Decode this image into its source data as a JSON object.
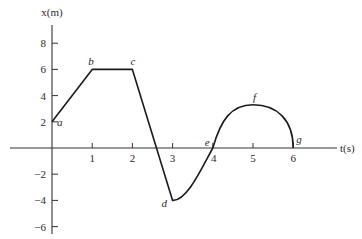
{
  "chart_data": {
    "type": "line",
    "title": "",
    "xlabel": "t(s)",
    "ylabel": "x(m)",
    "xlim": [
      0,
      6
    ],
    "ylim": [
      -6,
      8
    ],
    "grid": false,
    "legend": null,
    "x_ticks": [
      1,
      2,
      3,
      4,
      5,
      6
    ],
    "x_tick_labels": [
      "1",
      "2",
      "3",
      "4",
      "5",
      "6"
    ],
    "y_ticks": [
      8,
      6,
      4,
      2,
      -2,
      -4,
      -6
    ],
    "y_tick_labels": [
      "8",
      "6",
      "4",
      "2",
      "−2",
      "−4",
      "−6"
    ],
    "series": [
      {
        "name": "position",
        "points": [
          {
            "label": "a",
            "t": 0,
            "x": 2
          },
          {
            "label": "b",
            "t": 1,
            "x": 6
          },
          {
            "label": "c",
            "t": 2,
            "x": 6
          },
          {
            "label": "d",
            "t": 3,
            "x": -4
          },
          {
            "label": "e",
            "t": 4,
            "x": 0
          },
          {
            "label": "f",
            "t": 5,
            "x": 3.3
          },
          {
            "label": "g",
            "t": 6,
            "x": 0
          }
        ],
        "segments": [
          {
            "from": "a",
            "to": "b",
            "shape": "straight"
          },
          {
            "from": "b",
            "to": "c",
            "shape": "straight"
          },
          {
            "from": "c",
            "to": "d",
            "shape": "straight"
          },
          {
            "from": "d",
            "to": "e",
            "shape": "curve"
          },
          {
            "from": "e",
            "to": "g",
            "shape": "curve",
            "peak": "f"
          }
        ]
      }
    ],
    "colors": {
      "line": "#1a1a1a",
      "axis": "#333333",
      "text": "#2a2a2a"
    }
  }
}
